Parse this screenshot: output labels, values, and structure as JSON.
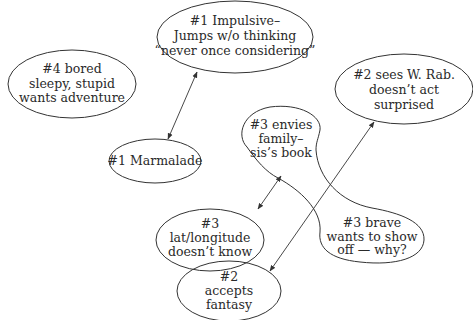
{
  "diagram": {
    "type": "concept-map",
    "colors": {
      "stroke": "#333333",
      "text": "#2a2a2a",
      "background": "#ffffff"
    },
    "nodes": [
      {
        "id": "impulsive",
        "lines": [
          "#1 Impulsive–",
          "Jumps w/o thinking",
          "“never once considering”"
        ]
      },
      {
        "id": "bored",
        "lines": [
          "#4 bored",
          "sleepy, stupid",
          "wants adventure"
        ]
      },
      {
        "id": "sees",
        "lines": [
          "#2 sees W. Rab.",
          "doesn’t act",
          "surprised"
        ]
      },
      {
        "id": "marmalade",
        "lines": [
          "#1 Marmalade"
        ]
      },
      {
        "id": "envies",
        "lines": [
          "#3 envies",
          "family–",
          "sis’s book"
        ]
      },
      {
        "id": "brave",
        "lines": [
          "#3 brave",
          "wants to show",
          "off — why?"
        ]
      },
      {
        "id": "latitude",
        "lines": [
          "#3",
          "lat/longitude",
          "doesn’t know"
        ]
      },
      {
        "id": "accepts",
        "lines": [
          "#2",
          "accepts",
          "fantasy"
        ]
      }
    ],
    "edges": [
      {
        "from": "impulsive",
        "to": "marmalade",
        "arrows": "both"
      },
      {
        "from": "envies",
        "to": "latitude",
        "arrows": "both"
      },
      {
        "from": "sees",
        "to": "accepts",
        "arrows": "both"
      }
    ]
  }
}
